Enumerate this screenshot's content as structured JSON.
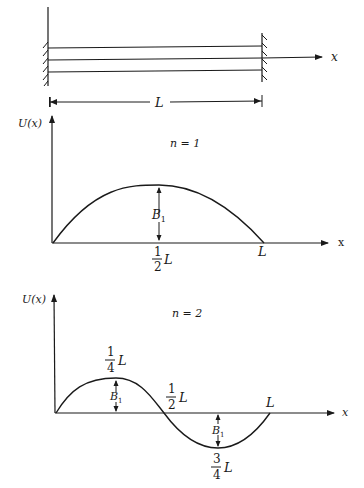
{
  "beam": {
    "x_axis_label": "x",
    "length_label": "L",
    "left_wall": "fixed",
    "right_wall": "fixed",
    "beam_line_count": 3
  },
  "mode1": {
    "y_axis_label": "U(x)",
    "x_axis_label": "x",
    "mode_label": "n = 1",
    "amplitude_label": "B",
    "amplitude_subscript": "1",
    "peak_label": {
      "num": "1",
      "den": "2",
      "suffix": "L"
    },
    "end_label": "L"
  },
  "mode2": {
    "y_axis_label": "U(x)",
    "x_axis_label": "x",
    "mode_label": "n = 2",
    "amplitude_label": "B",
    "amplitude_subscript": "1",
    "peak_label": {
      "num": "1",
      "den": "4",
      "suffix": "L"
    },
    "node_label": {
      "num": "1",
      "den": "2",
      "suffix": "L"
    },
    "trough_label": {
      "num": "3",
      "den": "4",
      "suffix": "L"
    },
    "end_label": "L"
  },
  "colors": {
    "ink": "#1a1a1a",
    "background": "#ffffff"
  }
}
